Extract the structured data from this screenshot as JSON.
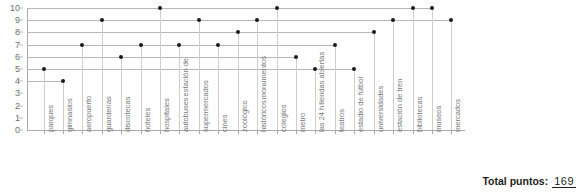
{
  "chart_data": {
    "type": "scatter",
    "title": "",
    "xlabel": "",
    "ylabel": "",
    "ylim": [
      0,
      10
    ],
    "grid": true,
    "legend": "none",
    "y_ticks": [
      10,
      9,
      8,
      7,
      6,
      5,
      4,
      3,
      2,
      1,
      0
    ],
    "categories": [
      "parques",
      "gimnasios",
      "aeropuerto",
      "guarderías",
      "discotecas",
      "hoteles",
      "hospitales",
      "estación de autobuses",
      "supermercados",
      "cines",
      "zoológico",
      "monumentos históricos",
      "colegios",
      "metro",
      "tiendas abiertas las 24 h",
      "teatros",
      "estadio de fútbol",
      "universidades",
      "estación de tren",
      "bibliotecas",
      "museos",
      "mercados"
    ],
    "values": [
      5,
      4,
      7,
      9,
      6,
      7,
      10,
      7,
      9,
      7,
      8,
      9,
      10,
      6,
      5,
      7,
      5,
      8,
      9,
      10,
      10,
      9
    ]
  },
  "footer": {
    "total_label": "Total puntos:",
    "total_value": "169"
  },
  "colors": {
    "dot": "#1a1a1a",
    "grid": "#b5b7b9",
    "vline": "#cccecf",
    "axis": "#a8aaac",
    "label_text": "#76797b",
    "tick_text": "#6d6f71",
    "total_text": "#231f20",
    "background": "#ffffff"
  }
}
